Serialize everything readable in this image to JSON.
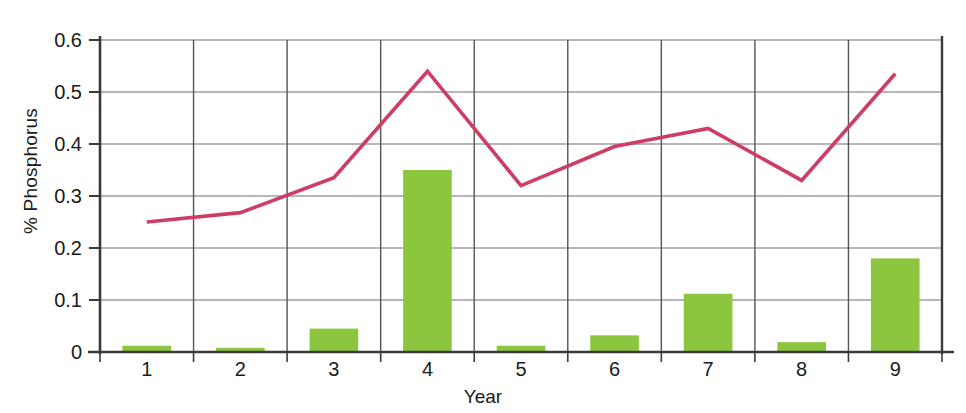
{
  "chart_data": {
    "type": "bar",
    "title": "",
    "subtitle": "",
    "xlabel": "Year",
    "ylabel": "% Phosphorus",
    "categories": [
      "1",
      "2",
      "3",
      "4",
      "5",
      "6",
      "7",
      "8",
      "9"
    ],
    "ylim": [
      0,
      0.6
    ],
    "yticks": [
      "0",
      "0.1",
      "0.2",
      "0.3",
      "0.4",
      "0.5",
      "0.6"
    ],
    "ytick_values": [
      0,
      0.1,
      0.2,
      0.3,
      0.4,
      0.5,
      0.6
    ],
    "grid": true,
    "grid_axes": "both",
    "legend": "none",
    "series": [
      {
        "name": "bars",
        "type": "bar",
        "color": "#8CC63F",
        "values": [
          0.012,
          0.008,
          0.045,
          0.35,
          0.012,
          0.032,
          0.112,
          0.019,
          0.18
        ]
      },
      {
        "name": "line",
        "type": "line",
        "color": "#CE3D63",
        "values": [
          0.25,
          0.268,
          0.335,
          0.54,
          0.32,
          0.395,
          0.43,
          0.33,
          0.535
        ]
      }
    ],
    "annotations": []
  },
  "axis": {
    "y_title": "% Phosphorus",
    "x_title": "Year"
  }
}
